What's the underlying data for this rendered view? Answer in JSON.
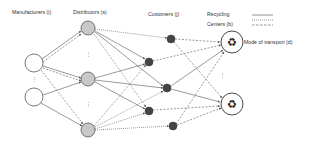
{
  "headers": {
    "manufacturers": "Manufacturers (i)",
    "distributors": "Distributors (s)",
    "customers": "Customers (j)",
    "recycling_line1": "Recycling",
    "recycling_line2": "Centers (b)",
    "mode": "Mode of transport (d)"
  },
  "legend": {
    "styles": [
      "solid",
      "dotted",
      "dashed"
    ]
  },
  "nodes": {
    "manufacturers": [
      {
        "x": 34,
        "y": 63
      },
      {
        "x": 34,
        "y": 97
      }
    ],
    "distributors": [
      {
        "x": 88,
        "y": 28
      },
      {
        "x": 88,
        "y": 79
      },
      {
        "x": 88,
        "y": 130
      }
    ],
    "customers": [
      {
        "x": 171,
        "y": 39
      },
      {
        "x": 149,
        "y": 62
      },
      {
        "x": 167,
        "y": 88
      },
      {
        "x": 149,
        "y": 111
      },
      {
        "x": 173,
        "y": 126
      }
    ],
    "recycling_centers": [
      {
        "x": 232,
        "y": 42
      },
      {
        "x": 232,
        "y": 104
      }
    ]
  },
  "colors": {
    "edge": "#555555",
    "manufacturer_fill": "#ffffff",
    "distributor_fill": "#c8c8c8",
    "customer_fill": "#444444",
    "recycling_fill": "#ffffff"
  }
}
